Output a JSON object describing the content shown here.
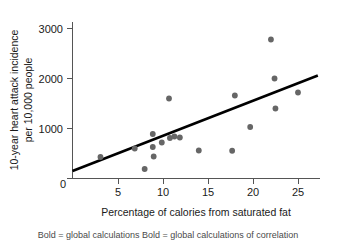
{
  "chart_data": {
    "type": "scatter",
    "title": "",
    "xlabel": "Percentage of calories from saturated fat",
    "ylabel": "10-year heart attack incidence\nper 10,000 people",
    "ylabel_line1": "10-year heart attack incidence",
    "ylabel_line2": "per 10,000 people",
    "xlim": [
      0,
      27.5
    ],
    "ylim": [
      0,
      3300
    ],
    "xticks": [
      0,
      5,
      10,
      15,
      20,
      25
    ],
    "xtick_labels": [
      "0",
      "5",
      "10",
      "15",
      "20",
      "25"
    ],
    "yticks": [
      0,
      1000,
      2000,
      3000
    ],
    "ytick_labels": [
      "0",
      "1000",
      "2000",
      "3000"
    ],
    "grid": false,
    "legend": false,
    "point_color": "#666666",
    "line_color": "#000000",
    "axis_color": "#555555",
    "points": [
      {
        "x": 3.1,
        "y": 430
      },
      {
        "x": 6.9,
        "y": 600
      },
      {
        "x": 8.0,
        "y": 190
      },
      {
        "x": 8.9,
        "y": 890
      },
      {
        "x": 8.9,
        "y": 630
      },
      {
        "x": 9.0,
        "y": 440
      },
      {
        "x": 9.9,
        "y": 720
      },
      {
        "x": 10.7,
        "y": 1600
      },
      {
        "x": 10.8,
        "y": 810
      },
      {
        "x": 11.3,
        "y": 840
      },
      {
        "x": 11.9,
        "y": 820
      },
      {
        "x": 14.0,
        "y": 560
      },
      {
        "x": 17.7,
        "y": 555
      },
      {
        "x": 18.0,
        "y": 1660
      },
      {
        "x": 19.7,
        "y": 1030
      },
      {
        "x": 22.0,
        "y": 2780
      },
      {
        "x": 22.4,
        "y": 2000
      },
      {
        "x": 22.5,
        "y": 1400
      },
      {
        "x": 25.0,
        "y": 1720
      }
    ],
    "trend_line": {
      "x_start": 0,
      "y_start": 150,
      "x_end": 27.2,
      "y_end": 2060
    }
  },
  "caption": {
    "text": "Bold = global calculations    Bold = global calculations of correlation"
  }
}
